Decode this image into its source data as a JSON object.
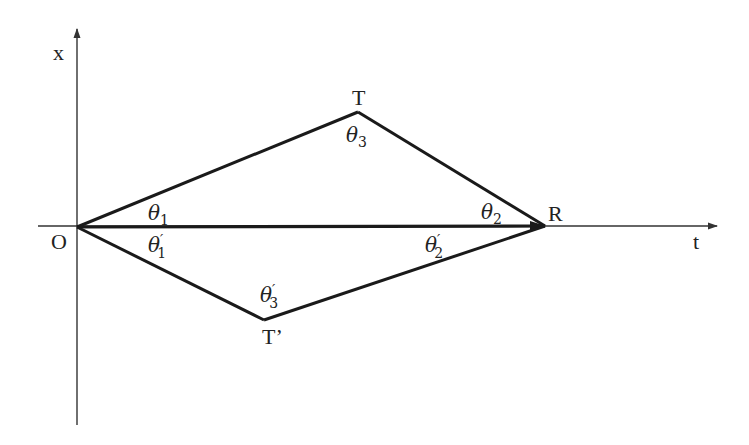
{
  "diagram": {
    "colors": {
      "line": "#1a1a1a",
      "axis": "#333333",
      "background": "#ffffff"
    },
    "axes": {
      "vertical": {
        "label": "x"
      },
      "horizontal": {
        "label": "t"
      }
    },
    "points": {
      "O": {
        "label": "O"
      },
      "T": {
        "label": "T"
      },
      "R": {
        "label": "R"
      },
      "T_prime": {
        "label": "T’"
      }
    },
    "segments": [
      "O–T",
      "T–R",
      "O–R",
      "O–T’",
      "T’–R"
    ],
    "angles": {
      "theta1": {
        "base": "θ",
        "sub": "1",
        "prime": ""
      },
      "theta2": {
        "base": "θ",
        "sub": "2",
        "prime": ""
      },
      "theta3": {
        "base": "θ",
        "sub": "3",
        "prime": ""
      },
      "theta1p": {
        "base": "θ",
        "sub": "1",
        "prime": "′"
      },
      "theta2p": {
        "base": "θ",
        "sub": "2",
        "prime": "′"
      },
      "theta3p": {
        "base": "θ",
        "sub": "3",
        "prime": "′"
      }
    }
  }
}
